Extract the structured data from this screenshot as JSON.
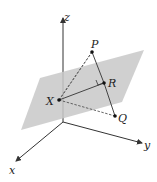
{
  "diagram": {
    "type": "3d-geometry",
    "axes": {
      "x_label": "x",
      "y_label": "y",
      "z_label": "z"
    },
    "points": {
      "P": "P",
      "R": "R",
      "X": "X",
      "Q": "Q"
    },
    "colors": {
      "plane_fill": "#c8c8c8",
      "line": "#333333",
      "background": "#ffffff"
    }
  }
}
